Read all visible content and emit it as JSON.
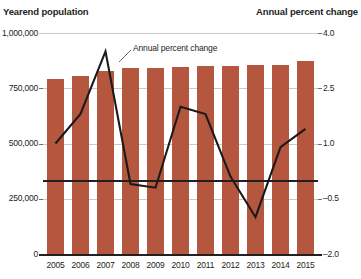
{
  "chart_data": {
    "type": "bar",
    "title": "",
    "categories": [
      "2005",
      "2006",
      "2007",
      "2008",
      "2009",
      "2010",
      "2011",
      "2012",
      "2013",
      "2014",
      "2015"
    ],
    "series": [
      {
        "name": "Yearend population",
        "type": "bar",
        "axis": "left",
        "values": [
          790000,
          805000,
          830000,
          840000,
          840000,
          845000,
          850000,
          850000,
          855000,
          855000,
          875000
        ]
      },
      {
        "name": "Annual percent change",
        "type": "line",
        "axis": "right",
        "values": [
          1.0,
          1.8,
          3.5,
          -0.1,
          -0.2,
          2.0,
          1.8,
          0.1,
          -1.0,
          0.9,
          1.4
        ]
      }
    ],
    "left_axis": {
      "label": "Yearend population",
      "ticks": [
        "1,000,000",
        "750,000",
        "500,000",
        "250,000",
        "0"
      ],
      "tick_values": [
        1000000,
        750000,
        500000,
        250000,
        0
      ],
      "ylim": [
        0,
        1000000
      ]
    },
    "right_axis": {
      "label": "Annual percent change",
      "ticks": [
        "4.0",
        "2.5",
        "1.0",
        "–0.5",
        "–2.0"
      ],
      "tick_values": [
        4.0,
        2.5,
        1.0,
        -0.5,
        -2.0
      ],
      "ylim": [
        -2.0,
        4.0
      ]
    },
    "xlabel": "",
    "grid": true,
    "legend": "none",
    "annotations": [
      {
        "text": "Annual percent change",
        "target_category": "2007"
      }
    ],
    "colors": {
      "bar": "#b5563f",
      "line": "#1a1a1a",
      "gridline": "#c9c9c9",
      "text": "#231f20"
    }
  }
}
